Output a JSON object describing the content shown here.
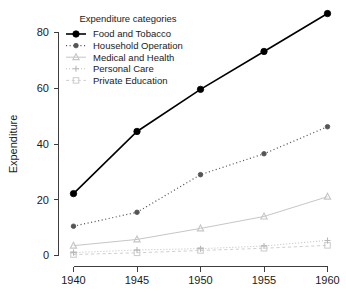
{
  "chart_data": {
    "type": "line",
    "title": "",
    "xlabel": "",
    "ylabel": "Expenditure",
    "x": [
      1940,
      1945,
      1950,
      1955,
      1960
    ],
    "categories": [
      "1940",
      "1945",
      "1950",
      "1955",
      "1960"
    ],
    "xticklabels": [
      "1940",
      "1945",
      "1950",
      "1955",
      "1960"
    ],
    "yticklabels": [
      "0",
      "20",
      "40",
      "60",
      "80"
    ],
    "yticks": [
      0,
      20,
      40,
      60,
      80
    ],
    "xlim": [
      1938.5,
      1961.5
    ],
    "ylim": [
      0,
      86
    ],
    "grid": false,
    "legend_position": "top-left",
    "legend_title": "Expenditure categories",
    "series": [
      {
        "name": "Food and Tobacco",
        "values": [
          22.2,
          44.5,
          59.6,
          73.2,
          86.8
        ],
        "color": "#000000",
        "linestyle": "solid",
        "marker": "circle-filled",
        "markersize": 5.2,
        "linewidth": 1.6
      },
      {
        "name": "Household Operation",
        "values": [
          10.5,
          15.5,
          29.0,
          36.5,
          46.2
        ],
        "color": "#555555",
        "linestyle": "dotted",
        "marker": "circle-filled",
        "markersize": 3.4,
        "linewidth": 1.2
      },
      {
        "name": "Medical and Health",
        "values": [
          3.53,
          5.76,
          9.71,
          14.0,
          21.1
        ],
        "color": "#c6c6c6",
        "linestyle": "solid",
        "marker": "triangle-up",
        "markersize": 3.6,
        "linewidth": 1.0
      },
      {
        "name": "Personal Care",
        "values": [
          1.04,
          1.98,
          2.45,
          3.4,
          5.4
        ],
        "color": "#b8b8b8",
        "linestyle": "dotted",
        "marker": "plus",
        "markersize": 3.2,
        "linewidth": 1.0
      },
      {
        "name": "Private Education",
        "values": [
          0.341,
          0.974,
          1.8,
          2.6,
          3.64
        ],
        "color": "#cfcfcf",
        "linestyle": "dashed",
        "marker": "square",
        "markersize": 3.0,
        "linewidth": 1.0
      }
    ]
  },
  "legend": {
    "title": "Expenditure categories",
    "entries": [
      {
        "label": "Food and Tobacco",
        "icon": "legend-key-line-circle"
      },
      {
        "label": "Household Operation",
        "icon": "legend-key-dotted-circle"
      },
      {
        "label": "Medical and Health",
        "icon": "legend-key-triangle"
      },
      {
        "label": "Personal Care",
        "icon": "legend-key-plus"
      },
      {
        "label": "Private Education",
        "icon": "legend-key-square"
      }
    ]
  },
  "axes": {
    "y_label": "Expenditure",
    "x_tick_labels": [
      "1940",
      "1945",
      "1950",
      "1955",
      "1960"
    ],
    "y_tick_labels": [
      "0",
      "20",
      "40",
      "60",
      "80"
    ]
  }
}
